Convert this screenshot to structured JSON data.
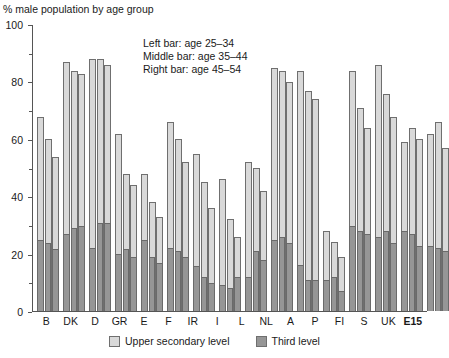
{
  "chart_data": {
    "type": "bar",
    "title": "% male population by age group",
    "xlabel": "",
    "ylabel": "",
    "ylim": [
      0,
      100
    ],
    "yticks": [
      0,
      20,
      40,
      60,
      80,
      100
    ],
    "ytick_labels": [
      "0",
      "20",
      "40",
      "60",
      "80",
      "100"
    ],
    "grid": false,
    "stacked": true,
    "legend_position": "bottom",
    "annotation": [
      "Left bar: age 25–34",
      "Middle bar: age 35–44",
      "Right bar: age 45–54"
    ],
    "legend": [
      {
        "name": "Upper secondary level",
        "color": "#d9d9d9"
      },
      {
        "name": "Third level",
        "color": "#969696"
      }
    ],
    "categories": [
      "B",
      "DK",
      "D",
      "GR",
      "E",
      "F",
      "IR",
      "I",
      "L",
      "NL",
      "A",
      "P",
      "FI",
      "S",
      "UK",
      "E15"
    ],
    "categories_bold": [
      "E15"
    ],
    "age_groups": [
      "25–34",
      "35–44",
      "45–54"
    ],
    "series": [
      {
        "name": "Upper secondary level",
        "note": "total bar height (upper secondary and above)",
        "values_by_age": {
          "25–34": [
            68,
            87,
            88,
            62,
            48,
            66,
            55,
            46,
            52,
            85,
            84,
            28,
            84,
            86,
            59,
            62
          ],
          "35–44": [
            60,
            84,
            88,
            48,
            38,
            60,
            45,
            32,
            50,
            84,
            77,
            24,
            71,
            76,
            64,
            66
          ],
          "45–54": [
            54,
            83,
            86,
            44,
            33,
            52,
            36,
            26,
            42,
            80,
            74,
            19,
            64,
            68,
            60,
            57
          ]
        }
      },
      {
        "name": "Third level",
        "note": "dark lower segment of each stacked bar",
        "values_by_age": {
          "25–34": [
            25,
            27,
            22,
            20,
            25,
            22,
            16,
            9,
            12,
            25,
            16,
            11,
            30,
            26,
            28,
            23
          ],
          "35–44": [
            24,
            29,
            31,
            22,
            19,
            21,
            12,
            8,
            21,
            26,
            11,
            12,
            28,
            28,
            27,
            22
          ],
          "45–54": [
            22,
            30,
            31,
            19,
            17,
            19,
            10,
            12,
            18,
            24,
            11,
            7,
            27,
            24,
            23,
            21
          ]
        }
      }
    ]
  }
}
